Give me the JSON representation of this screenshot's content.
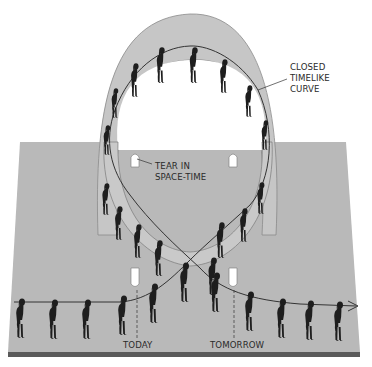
{
  "diagram": {
    "colors": {
      "plane": "#b8b8b8",
      "plane_edge": "#5a5a5a",
      "tube": "#c4c4c4",
      "tube_inner": "#d8d8d8",
      "silhouette": "#1e1e1e",
      "line": "#333333",
      "text": "#2a2a2a",
      "tear": "#ffffff"
    },
    "labels": {
      "closed_timelike_curve": "CLOSED\nTIMELIKE\nCURVE",
      "tear": "TEAR IN\nSPACE-TIME",
      "today": "TODAY",
      "tomorrow": "TOMORROW"
    },
    "figures_on_timeline_left": 5,
    "figures_on_timeline_right": 4,
    "figures_on_loop": 16,
    "arrow_direction": "right"
  }
}
